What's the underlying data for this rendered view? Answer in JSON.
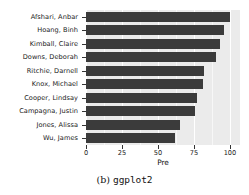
{
  "chart_data": {
    "type": "bar",
    "orientation": "horizontal",
    "title": "",
    "xlabel": "Pre",
    "ylabel": "",
    "categories": [
      "Afshari, Anbar",
      "Hoang, Binh",
      "Kimball, Claire",
      "Downs, Deborah",
      "Ritchie, Darnell",
      "Knox, Michael",
      "Cooper, Lindsay",
      "Campagna, Justin",
      "Jones, Alissa",
      "Wu, James"
    ],
    "values": [
      100,
      96,
      93,
      90,
      82,
      81,
      77,
      76,
      65,
      62
    ],
    "xlim": [
      0,
      107
    ],
    "xticks": [
      0,
      25,
      50,
      75,
      100
    ],
    "xtick_labels": [
      "0",
      "25",
      "50",
      "75",
      "100"
    ],
    "minor_xticks": [
      12.5,
      37.5,
      62.5,
      87.5
    ],
    "grid": true,
    "legend": "none",
    "colors": {
      "bar": "#3b3b3b",
      "panel_background": "#ebebeb",
      "major_gridline": "#ffffff",
      "minor_gridline": "#f7f7f7",
      "axis_text": "#1a1a1a"
    }
  },
  "caption": {
    "label": "(b)",
    "name": "ggplot2"
  }
}
